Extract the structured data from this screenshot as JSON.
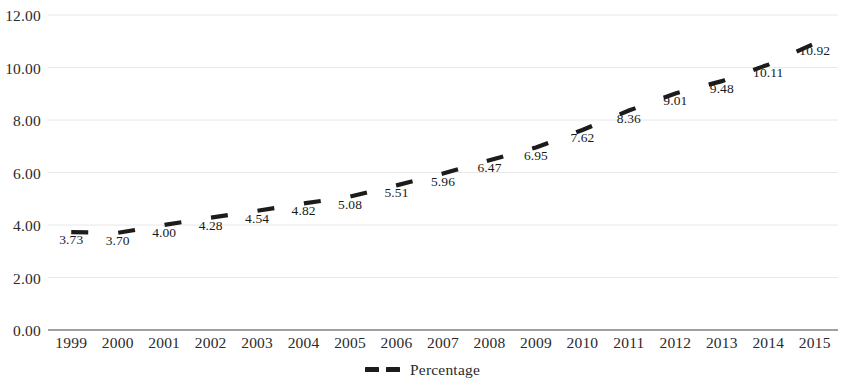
{
  "chart_data": {
    "type": "line",
    "title": "",
    "subtitle": "",
    "xlabel": "",
    "ylabel": "",
    "categories": [
      "1999",
      "2000",
      "2001",
      "2002",
      "2003",
      "2004",
      "2005",
      "2006",
      "2007",
      "2008",
      "2009",
      "2010",
      "2011",
      "2012",
      "2013",
      "2014",
      "2015"
    ],
    "series": [
      {
        "name": "Percentage",
        "values": [
          3.73,
          3.7,
          4.0,
          4.28,
          4.54,
          4.82,
          5.08,
          5.51,
          5.96,
          6.47,
          6.95,
          7.62,
          8.36,
          9.01,
          9.48,
          10.11,
          10.92
        ],
        "labels": [
          "3.73",
          "3.70",
          "4.00",
          "4.28",
          "4.54",
          "4.82",
          "5.08",
          "5.51",
          "5.96",
          "6.47",
          "6.95",
          "7.62",
          "8.36",
          "9.01",
          "9.48",
          "10.11",
          "10.92"
        ],
        "color": "#1c1c1c",
        "style": "dashed",
        "data_labels_shown": true
      }
    ],
    "ylim": [
      0,
      12
    ],
    "ytick_step": 2,
    "ytick_labels": [
      "0.00",
      "2.00",
      "4.00",
      "6.00",
      "8.00",
      "10.00",
      "12.00"
    ],
    "ytick_values": [
      0,
      2,
      4,
      6,
      8,
      10,
      12
    ],
    "grid": true,
    "grid_color": "#e8e8e8",
    "axis_color": "#808080",
    "legend_position": "bottom-center",
    "legend_entries": [
      "Percentage"
    ],
    "background": "#ffffff"
  },
  "legend": {
    "label": "Percentage",
    "marker": "dashed-line-marker"
  }
}
